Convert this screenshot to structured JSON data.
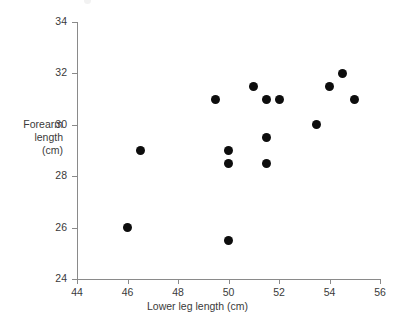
{
  "chart_data": {
    "type": "scatter",
    "title": "",
    "xlabel": "Lower leg length (cm)",
    "ylabel_lines": [
      "Forearm",
      "length",
      "(cm)"
    ],
    "ylabel": "Forearm length (cm)",
    "xlim": [
      44,
      56
    ],
    "ylim": [
      24,
      34
    ],
    "xticks": [
      44,
      46,
      48,
      50,
      52,
      54,
      56
    ],
    "yticks": [
      24,
      26,
      28,
      30,
      32,
      34
    ],
    "xtick_labels": [
      "44",
      "46",
      "48",
      "50",
      "52",
      "54",
      "56"
    ],
    "ytick_labels": [
      "24",
      "26",
      "28",
      "30",
      "32",
      "34"
    ],
    "grid": false,
    "legend": null,
    "marker": "filled-circle",
    "marker_color": "#0d0d0d",
    "axis_color": "#8a8a8a",
    "text_color": "#3a3a3a",
    "background": "#ffffff",
    "points": [
      {
        "x": 46.0,
        "y": 26.0
      },
      {
        "x": 46.5,
        "y": 29.0
      },
      {
        "x": 49.5,
        "y": 31.0
      },
      {
        "x": 50.0,
        "y": 25.5
      },
      {
        "x": 50.0,
        "y": 28.5
      },
      {
        "x": 50.0,
        "y": 29.0
      },
      {
        "x": 51.0,
        "y": 31.5
      },
      {
        "x": 51.5,
        "y": 28.5
      },
      {
        "x": 51.5,
        "y": 29.5
      },
      {
        "x": 51.5,
        "y": 31.0
      },
      {
        "x": 52.0,
        "y": 31.0
      },
      {
        "x": 53.5,
        "y": 30.0
      },
      {
        "x": 54.0,
        "y": 31.5
      },
      {
        "x": 54.5,
        "y": 32.0
      },
      {
        "x": 55.0,
        "y": 31.0
      }
    ]
  }
}
